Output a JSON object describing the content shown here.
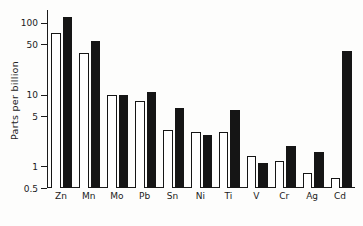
{
  "chart_data": {
    "type": "bar",
    "title": "",
    "xlabel": "",
    "ylabel": "Parts per billion",
    "yscale": "log",
    "ylim": [
      0.5,
      150
    ],
    "grid": false,
    "legend_position": "none",
    "y_ticks": [
      {
        "value": 100,
        "label": "100"
      },
      {
        "value": 50,
        "label": "50"
      },
      {
        "value": 10,
        "label": "10"
      },
      {
        "value": 5,
        "label": "5"
      },
      {
        "value": 1,
        "label": "1"
      },
      {
        "value": 0.5,
        "label": "0.5"
      }
    ],
    "categories": [
      "Zn",
      "Mn",
      "Mo",
      "Pb",
      "Sn",
      "Ni",
      "Ti",
      "V",
      "Cr",
      "Ag",
      "Cd"
    ],
    "series": [
      {
        "name": "open",
        "style": "open",
        "values": [
          72,
          38,
          10,
          8,
          3.2,
          3.0,
          3.0,
          1.4,
          1.2,
          0.8,
          0.7
        ]
      },
      {
        "name": "filled",
        "style": "filled",
        "values": [
          120,
          55,
          10,
          11,
          6.5,
          2.7,
          6.0,
          1.1,
          1.9,
          1.6,
          40
        ]
      }
    ]
  }
}
